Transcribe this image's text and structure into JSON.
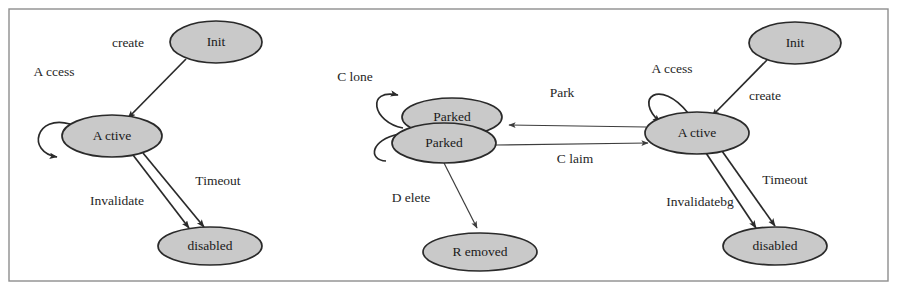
{
  "figure": {
    "kind": "state-transition-diagram",
    "panel_count": 3,
    "colors": {
      "state_fill": "#c9c9c9",
      "state_stroke": "#2a2a2a",
      "edge_stroke": "#2a2a2a",
      "frame_stroke": "#8e8e8e",
      "background": "#ffffff",
      "text": "#1a1a1a"
    }
  },
  "panels": [
    {
      "id": "left-panel",
      "states": [
        {
          "id": "left-init",
          "label": "Init",
          "cx": 216,
          "cy": 42,
          "rx": 46,
          "ry": 21
        },
        {
          "id": "left-active",
          "label": "A ctive",
          "cx": 112,
          "cy": 136,
          "rx": 50,
          "ry": 21
        },
        {
          "id": "left-disabled",
          "label": "disabled",
          "cx": 210,
          "cy": 246,
          "rx": 52,
          "ry": 19
        }
      ],
      "transitions": [
        {
          "id": "left-create",
          "label": "create",
          "from": "Init",
          "to": "A ctive",
          "label_x": 128,
          "label_y": 44
        },
        {
          "id": "left-access",
          "label": "A ccess",
          "from": "A ctive",
          "to": "A ctive",
          "self_loop": true,
          "label_x": 54,
          "label_y": 73
        },
        {
          "id": "left-timeout",
          "label": "Timeout",
          "from": "A ctive",
          "to": "disabled",
          "label_x": 218,
          "label_y": 182
        },
        {
          "id": "left-invalidate",
          "label": "Invalidate",
          "from": "A ctive",
          "to": "disabled",
          "label_x": 117,
          "label_y": 202
        }
      ]
    },
    {
      "id": "middle-panel",
      "states": [
        {
          "id": "mid-parked-upper",
          "label": "Parked",
          "cx": 452,
          "cy": 117,
          "rx": 50,
          "ry": 19
        },
        {
          "id": "mid-parked-lower",
          "label": "Parked",
          "cx": 444,
          "cy": 143,
          "rx": 52,
          "ry": 20
        },
        {
          "id": "mid-removed",
          "label": "R emoved",
          "cx": 480,
          "cy": 252,
          "rx": 57,
          "ry": 19
        }
      ],
      "transitions": [
        {
          "id": "mid-clone",
          "label": "C lone",
          "from": "Parked",
          "to": "Parked",
          "self_loop": true,
          "label_x": 355,
          "label_y": 78
        },
        {
          "id": "mid-park",
          "label": "Park",
          "from": "A ctive",
          "to": "Parked",
          "label_x": 562,
          "label_y": 94
        },
        {
          "id": "mid-claim",
          "label": "C laim",
          "from": "Parked",
          "to": "A ctive",
          "label_x": 575,
          "label_y": 160
        },
        {
          "id": "mid-delete",
          "label": "D elete",
          "from": "Parked",
          "to": "R emoved",
          "label_x": 411,
          "label_y": 199
        }
      ]
    },
    {
      "id": "right-panel",
      "states": [
        {
          "id": "right-init",
          "label": "Init",
          "cx": 795,
          "cy": 43,
          "rx": 46,
          "ry": 21
        },
        {
          "id": "right-active",
          "label": "A ctive",
          "cx": 697,
          "cy": 133,
          "rx": 52,
          "ry": 21
        },
        {
          "id": "right-disabled",
          "label": "disabled",
          "cx": 775,
          "cy": 246,
          "rx": 52,
          "ry": 19
        }
      ],
      "transitions": [
        {
          "id": "right-access",
          "label": "A ccess",
          "from": "A ctive",
          "to": "A ctive",
          "self_loop": true,
          "label_x": 672,
          "label_y": 70
        },
        {
          "id": "right-create",
          "label": "create",
          "from": "Init",
          "to": "A ctive",
          "label_x": 765,
          "label_y": 97
        },
        {
          "id": "right-timeout",
          "label": "Timeout",
          "from": "A ctive",
          "to": "disabled",
          "label_x": 785,
          "label_y": 181
        },
        {
          "id": "right-invalidate",
          "label": "Invalidatebg",
          "from": "A ctive",
          "to": "disabled",
          "label_x": 700,
          "label_y": 203
        }
      ]
    }
  ]
}
